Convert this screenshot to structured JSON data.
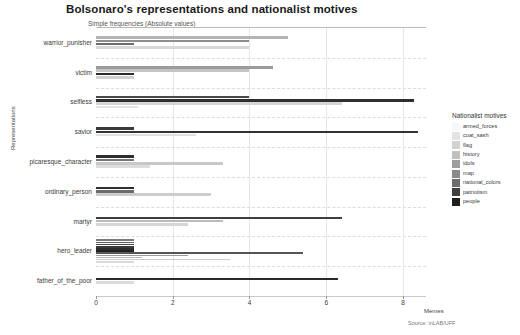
{
  "chart_data": {
    "type": "bar",
    "orientation": "horizontal",
    "title": "Bolsonaro's representations and nationalist motives",
    "subtitle": "Simple frequencies (Absolute values)",
    "xlabel": "Memes",
    "ylabel": "Representations",
    "source": "Source: inLAB/UFF",
    "legend_title": "Nationalist motives",
    "legend_position": "right",
    "grid": true,
    "xlim": [
      0,
      8.6
    ],
    "xticks": [
      0,
      2,
      4,
      6,
      8
    ],
    "xtick_labels": [
      "0",
      "2",
      "4",
      "6",
      "8"
    ],
    "categories": [
      "warrior_punisher",
      "victim",
      "selfless",
      "savior",
      "picaresque_character",
      "ordinary_person",
      "martyr",
      "hero_leader",
      "father_of_the_poor"
    ],
    "series": [
      {
        "name": "armed_forces",
        "color": "#f7f7f7",
        "values": [
          0,
          0,
          0,
          0,
          0,
          0,
          0,
          1.0,
          0
        ]
      },
      {
        "name": "coat_sash",
        "color": "#e4e4e4",
        "values": [
          0,
          0,
          0,
          0,
          0,
          0,
          0,
          1.0,
          0
        ]
      },
      {
        "name": "flag",
        "color": "#d2d2d2",
        "values": [
          5.0,
          4.0,
          0,
          0,
          0,
          0,
          0,
          1.0,
          0
        ]
      },
      {
        "name": "history",
        "color": "#c0c0c0",
        "values": [
          0,
          0,
          0,
          0,
          0,
          0,
          0,
          1.0,
          0
        ]
      },
      {
        "name": "idols",
        "color": "#9e9e9e",
        "values": [
          4.0,
          4.0,
          0,
          0,
          0,
          0,
          0,
          1.0,
          0
        ]
      },
      {
        "name": "map",
        "color": "#8a8a8a",
        "values": [
          0,
          0,
          0,
          0,
          0,
          0,
          0,
          1.0,
          0
        ]
      },
      {
        "name": "national_colors",
        "color": "#6d6d6d",
        "values": [
          1.0,
          0,
          4.0,
          4.0,
          3.3,
          3.0,
          3.3,
          1.0,
          0
        ]
      },
      {
        "name": "patriotism",
        "color": "#3f3f3f",
        "values": [
          0,
          0,
          0,
          0,
          0,
          0,
          0,
          1.0,
          0
        ]
      },
      {
        "name": "people",
        "color": "#1f1f1f",
        "values": [
          0,
          0,
          8.3,
          0,
          0,
          0,
          0,
          5.4,
          6.3
        ]
      }
    ],
    "bar_groups": [
      {
        "category": "warrior_punisher",
        "bars": [
          {
            "series": "flag",
            "value": 5.0,
            "color": "#b4b4b4"
          },
          {
            "series": "idols",
            "value": 4.0,
            "color": "#8f8f8f"
          },
          {
            "series": "national_colors",
            "value": 1.0,
            "color": "#6d6d6d"
          },
          {
            "series": "people",
            "value": 4.0,
            "color": "#d8d8d8"
          }
        ]
      },
      {
        "category": "victim",
        "bars": [
          {
            "series": "flag",
            "value": 4.6,
            "color": "#9b9b9b"
          },
          {
            "series": "idols",
            "value": 4.0,
            "color": "#c4c4c4"
          },
          {
            "series": "national_colors",
            "value": 1.0,
            "color": "#2b2b2b"
          },
          {
            "series": "people",
            "value": 1.0,
            "color": "#d0d0d0"
          }
        ]
      },
      {
        "category": "selfless",
        "bars": [
          {
            "series": "national_colors",
            "value": 4.0,
            "color": "#4a4a4a"
          },
          {
            "series": "people",
            "value": 8.3,
            "color": "#2f2f2f"
          },
          {
            "series": "flag",
            "value": 6.4,
            "color": "#d5d5d5"
          },
          {
            "series": "history",
            "value": 1.1,
            "color": "#e3e3e3"
          }
        ]
      },
      {
        "category": "savior",
        "bars": [
          {
            "series": "national_colors",
            "value": 1.0,
            "color": "#3a3a3a"
          },
          {
            "series": "people",
            "value": 8.4,
            "color": "#333333"
          },
          {
            "series": "flag",
            "value": 2.6,
            "color": "#e0e0e0"
          }
        ]
      },
      {
        "category": "picaresque_character",
        "bars": [
          {
            "series": "national_colors",
            "value": 1.0,
            "color": "#2e2e2e"
          },
          {
            "series": "idols",
            "value": 1.0,
            "color": "#757575"
          },
          {
            "series": "flag",
            "value": 3.3,
            "color": "#c8c8c8"
          },
          {
            "series": "history",
            "value": 1.4,
            "color": "#dddddd"
          }
        ]
      },
      {
        "category": "ordinary_person",
        "bars": [
          {
            "series": "national_colors",
            "value": 1.0,
            "color": "#2e2e2e"
          },
          {
            "series": "idols",
            "value": 1.0,
            "color": "#6b6b6b"
          },
          {
            "series": "flag",
            "value": 3.0,
            "color": "#cdcdcd"
          }
        ]
      },
      {
        "category": "martyr",
        "bars": [
          {
            "series": "people",
            "value": 6.4,
            "color": "#3d3d3d"
          },
          {
            "series": "flag",
            "value": 3.3,
            "color": "#bcbcbc"
          },
          {
            "series": "history",
            "value": 2.4,
            "color": "#d6d6d6"
          }
        ]
      },
      {
        "category": "hero_leader",
        "bars": [
          {
            "series": "armed_forces",
            "value": 1.0,
            "color": "#7a7a7a"
          },
          {
            "series": "coat_sash",
            "value": 1.0,
            "color": "#5f5f5f"
          },
          {
            "series": "flag",
            "value": 1.0,
            "color": "#4a4a4a"
          },
          {
            "series": "history",
            "value": 1.0,
            "color": "#3a3a3a"
          },
          {
            "series": "idols",
            "value": 1.0,
            "color": "#2c2c2c"
          },
          {
            "series": "map",
            "value": 1.0,
            "color": "#222222"
          },
          {
            "series": "people",
            "value": 5.4,
            "color": "#555555"
          },
          {
            "series": "national_colors",
            "value": 2.4,
            "color": "#9a9a9a"
          },
          {
            "series": "patriotism",
            "value": 1.2,
            "color": "#b6b6b6"
          },
          {
            "series": "flag2",
            "value": 3.5,
            "color": "#cbcbcb"
          },
          {
            "series": "history2",
            "value": 1.0,
            "color": "#d9d9d9"
          }
        ]
      },
      {
        "category": "father_of_the_poor",
        "bars": [
          {
            "series": "people",
            "value": 6.3,
            "color": "#2a2a2a"
          },
          {
            "series": "flag",
            "value": 1.0,
            "color": "#dcdcdc"
          }
        ]
      }
    ]
  }
}
